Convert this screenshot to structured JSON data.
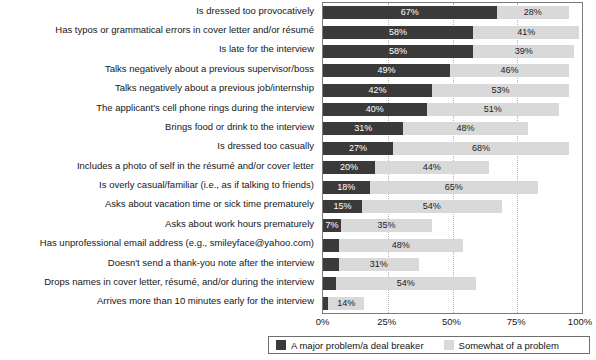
{
  "chart_data": {
    "type": "bar",
    "orientation": "horizontal",
    "stacked": true,
    "title": "",
    "subtitle": "",
    "xlabel": "",
    "ylabel": "",
    "xlim": [
      0,
      100
    ],
    "xticks": [
      "0%",
      "25%",
      "50%",
      "75%",
      "100%"
    ],
    "xtick_values": [
      0,
      25,
      50,
      75,
      100
    ],
    "grid": true,
    "grid_axis": "x",
    "grid_style": "dotted",
    "legend_position": "bottom",
    "value_suffix": "%",
    "categories": [
      "Is dressed too provocatively",
      "Has typos or grammatical errors in cover letter and/or résumé",
      "Is late for the interview",
      "Talks negatively about a previous supervisor/boss",
      "Talks negatively about a previous job/internship",
      "The applicant's cell phone rings during the interview",
      "Brings food or drink to the interview",
      "Is dressed too casually",
      "Includes a photo of self in the résumé and/or cover letter",
      "Is overly casual/familiar (i.e., as if talking to friends)",
      "Asks about vacation time or sick time prematurely",
      "Asks about work hours prematurely",
      "Has unprofessional email address (e.g., smileyface@yahoo.com)",
      "Doesn't send a thank-you note after the interview",
      "Drops names in cover letter, résumé, and/or during the interview",
      "Arrives more than 10 minutes early for the interview"
    ],
    "series": [
      {
        "name": "A major problem/a deal breaker",
        "color": "#3a3a3a",
        "values": [
          67,
          58,
          58,
          49,
          42,
          40,
          31,
          27,
          20,
          18,
          15,
          7,
          6,
          6,
          5,
          2
        ],
        "labels": [
          "67%",
          "58%",
          "58%",
          "49%",
          "42%",
          "40%",
          "31%",
          "27%",
          "20%",
          "18%",
          "15%",
          "7%",
          "",
          "",
          "",
          ""
        ]
      },
      {
        "name": "Somewhat of a problem",
        "color": "#d9d9d9",
        "values": [
          28,
          41,
          39,
          46,
          53,
          51,
          48,
          68,
          44,
          65,
          54,
          35,
          48,
          31,
          54,
          14
        ],
        "labels": [
          "28%",
          "41%",
          "39%",
          "46%",
          "53%",
          "51%",
          "48%",
          "68%",
          "44%",
          "65%",
          "54%",
          "35%",
          "48%",
          "31%",
          "54%",
          "14%"
        ]
      }
    ]
  }
}
